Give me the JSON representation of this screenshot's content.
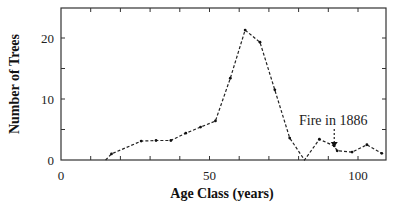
{
  "chart_data": {
    "type": "line",
    "title": "",
    "xlabel": "Age Class (years)",
    "ylabel": "Number of Trees",
    "xlim": [
      0,
      110
    ],
    "ylim": [
      0,
      25
    ],
    "x_ticks": [
      0,
      50,
      100
    ],
    "x_minor_ticks": [
      10,
      20,
      30,
      40,
      60,
      70,
      80,
      90
    ],
    "y_ticks": [
      0,
      10,
      20
    ],
    "y_minor_ticks": [
      5,
      15
    ],
    "grid": false,
    "legend": null,
    "line_style": "dotted-dashed",
    "series": [
      {
        "name": "Number of Trees",
        "x": [
          15,
          17,
          27,
          32,
          37,
          42,
          47,
          52,
          57,
          62,
          67,
          72,
          77,
          82,
          87,
          92,
          93,
          98,
          103,
          108
        ],
        "y": [
          0,
          1.0,
          3.1,
          3.2,
          3.2,
          4.4,
          5.4,
          6.4,
          13.4,
          21.3,
          19.3,
          11.5,
          3.6,
          0,
          3.4,
          2.3,
          1.5,
          1.3,
          2.5,
          1.1
        ]
      }
    ],
    "annotations": [
      {
        "text": "Fire in 1886",
        "x": 92,
        "y": 2.3,
        "arrow": true
      }
    ]
  },
  "labels": {
    "xlabel": "Age Class (years)",
    "ylabel": "Number of Trees",
    "annotation": "Fire in 1886",
    "xticks": [
      "0",
      "50",
      "100"
    ],
    "yticks": [
      "0",
      "10",
      "20"
    ]
  }
}
